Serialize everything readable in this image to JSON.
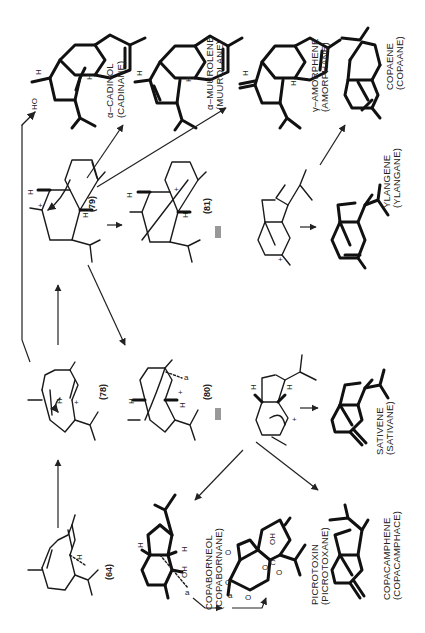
{
  "figure": {
    "orientation": "rotated-90-ccw"
  },
  "compounds": {
    "c64": {
      "number": "(64)",
      "atom_label": "H"
    },
    "c78": {
      "number": "(78)",
      "atom_label": "H",
      "charge": "+"
    },
    "c79": {
      "number": "(79)",
      "atom_labels": [
        "H",
        "H"
      ],
      "charge": "+"
    },
    "c80": {
      "number": "(80)",
      "atom_labels": [
        "H",
        "H"
      ],
      "charge": "+",
      "bond_label": "a"
    },
    "c81": {
      "number": "(81)",
      "atom_labels": [
        "H",
        "H"
      ],
      "charge": "+"
    },
    "cadinol": {
      "name": "α–CADINOL",
      "skeleton": "(CADINANE)",
      "atom_labels": [
        "HO",
        "H",
        "H"
      ]
    },
    "muurolene": {
      "name": "α–MUUROLENE",
      "skeleton": "(MUUROLANE)",
      "atom_labels": [
        "H",
        "H"
      ]
    },
    "amorphene": {
      "name": "γ–AMORPHENE",
      "skeleton": "(AMORPHANE)",
      "atom_labels": [
        "H",
        "H"
      ]
    },
    "copaene": {
      "name": "COPAENE",
      "skeleton": "(COPAANE)"
    },
    "ylangene": {
      "name": "YLANGENE",
      "skeleton": "(YLANGANE)"
    },
    "sativene": {
      "name": "SATIVENE",
      "skeleton": "(SATIVANE)"
    },
    "copaborneol": {
      "name": "COPABORNEOL",
      "skeleton": "(COPABORNANE)",
      "atom_labels": [
        "H",
        "H",
        "OH"
      ],
      "bond_label": "a"
    },
    "picrotoxin": {
      "name": "PICROTOXIN",
      "skeleton": "(PICROTOXANE)",
      "atom_labels": [
        "OH",
        "O",
        "O",
        "O",
        "O",
        "C",
        "O"
      ],
      "bond_label": "a"
    },
    "copacamphene": {
      "name": "COPACAMPHENE",
      "skeleton": "(COPACAMPHACE)"
    },
    "ylangene_cation": {
      "charge": "+"
    },
    "sativene_cation": {
      "charge": "+",
      "atom_labels": [
        "H",
        "H"
      ]
    }
  },
  "symbols": {
    "equivalence": "≡"
  }
}
